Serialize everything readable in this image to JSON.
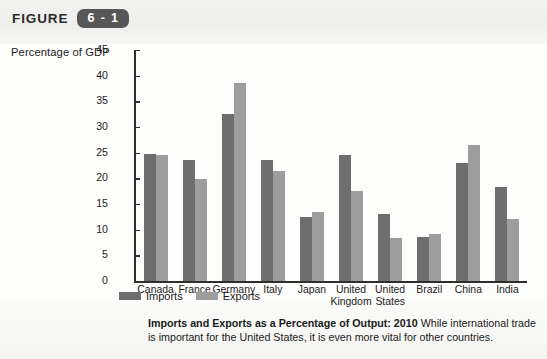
{
  "figure": {
    "label": "FIGURE",
    "number": "6 - 1"
  },
  "axis_title": "Percentage of GDP",
  "legend": {
    "imports_label": "Imports",
    "exports_label": "Exports"
  },
  "caption": {
    "bold": "Imports and Exports as a Percentage of Output: 2010",
    "rest": "While international trade is important for the United States, it is even more vital for other countries."
  },
  "colors": {
    "imports": "#6e6e6e",
    "exports": "#9d9d9d",
    "axis": "#2e2e2e",
    "badge": "#575757"
  },
  "chart_data": {
    "type": "bar",
    "title": "Imports and Exports as a Percentage of Output: 2010",
    "xlabel": "",
    "ylabel": "Percentage of GDP",
    "ylim": [
      0,
      45
    ],
    "yticks": [
      0,
      5,
      10,
      15,
      20,
      25,
      30,
      35,
      40,
      45
    ],
    "grid": false,
    "legend_position": "bottom-left",
    "categories": [
      "Canada",
      "France",
      "Germany",
      "Italy",
      "Japan",
      "United Kingdom",
      "United States",
      "Brazil",
      "China",
      "India"
    ],
    "series": [
      {
        "name": "Imports",
        "values": [
          24.8,
          23.5,
          32.5,
          23.5,
          12.4,
          24.6,
          13.0,
          8.5,
          23.0,
          18.3
        ]
      },
      {
        "name": "Exports",
        "values": [
          24.6,
          19.8,
          38.6,
          21.4,
          13.5,
          17.6,
          8.4,
          9.1,
          26.5,
          12.1
        ]
      }
    ]
  }
}
